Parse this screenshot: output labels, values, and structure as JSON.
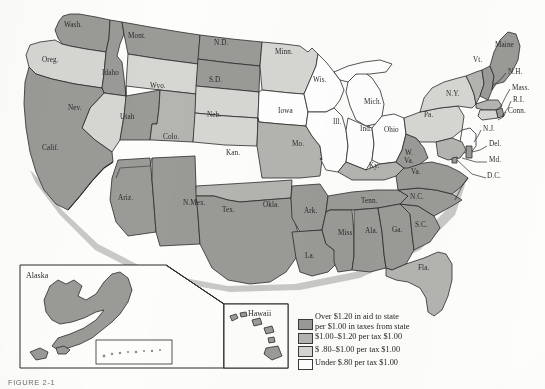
{
  "figure": {
    "caption": "FIGURE 2-1",
    "background_color": "#fdfdfc"
  },
  "palette": {
    "tier1_dark": "#9a9a97",
    "tier2_medium": "#b4b4b1",
    "tier3_light": "#d6d6d3",
    "tier4_white": "#ffffff",
    "outline": "#2a2a28",
    "label_color": "#2a2a28"
  },
  "legend": {
    "title": "",
    "items": [
      {
        "swatch_tier": "tier1_dark",
        "color": "#9a9a97",
        "line1": "Over $1.20 in aid to state",
        "line2": "per $1.00 in taxes from state"
      },
      {
        "swatch_tier": "tier2_medium",
        "color": "#b4b4b1",
        "line1": "$1.00–$1.20 per tax $1.00",
        "line2": ""
      },
      {
        "swatch_tier": "tier3_light",
        "color": "#d6d6d3",
        "line1": "$ .80–$1.00 per tax $1.00",
        "line2": ""
      },
      {
        "swatch_tier": "tier4_white",
        "color": "#ffffff",
        "line1": "Under $.80 per tax $1.00",
        "line2": ""
      }
    ]
  },
  "insets": [
    {
      "name": "alaska",
      "label": "Alaska"
    },
    {
      "name": "hawaii",
      "label": "Hawaii"
    }
  ],
  "map": {
    "title": "",
    "states": [
      {
        "abbr": "Wash.",
        "label": "Wash.",
        "tier": "tier1_dark",
        "lx": 64,
        "ly": 27
      },
      {
        "abbr": "Oreg.",
        "label": "Oreg.",
        "tier": "tier3_light",
        "lx": 42,
        "ly": 62
      },
      {
        "abbr": "Idaho",
        "label": "Idaho",
        "tier": "tier1_dark",
        "lx": 102,
        "ly": 75
      },
      {
        "abbr": "Mont.",
        "label": "Mont.",
        "tier": "tier1_dark",
        "lx": 128,
        "ly": 38
      },
      {
        "abbr": "Wyo.",
        "label": "Wyo.",
        "tier": "tier3_light",
        "lx": 150,
        "ly": 88
      },
      {
        "abbr": "Nev.",
        "label": "Nev.",
        "tier": "tier3_light",
        "lx": 68,
        "ly": 110
      },
      {
        "abbr": "Utah",
        "label": "Utah",
        "tier": "tier1_dark",
        "lx": 120,
        "ly": 119
      },
      {
        "abbr": "Calif.",
        "label": "Calif.",
        "tier": "tier1_dark",
        "lx": 42,
        "ly": 150
      },
      {
        "abbr": "Ariz.",
        "label": "Ariz.",
        "tier": "tier1_dark",
        "lx": 118,
        "ly": 200
      },
      {
        "abbr": "Colo.",
        "label": "Colo.",
        "tier": "tier2_medium",
        "lx": 163,
        "ly": 139
      },
      {
        "abbr": "N.Mex.",
        "label": "N.Mex.",
        "tier": "tier1_dark",
        "lx": 183,
        "ly": 205
      },
      {
        "abbr": "N.D.",
        "label": "N.D.",
        "tier": "tier1_dark",
        "lx": 214,
        "ly": 45
      },
      {
        "abbr": "S.D.",
        "label": "S.D.",
        "tier": "tier1_dark",
        "lx": 209,
        "ly": 82
      },
      {
        "abbr": "Neb.",
        "label": "Neb.",
        "tier": "tier3_light",
        "lx": 207,
        "ly": 117
      },
      {
        "abbr": "Kan.",
        "label": "Kan.",
        "tier": "tier3_light",
        "lx": 226,
        "ly": 155
      },
      {
        "abbr": "Okla.",
        "label": "Okla.",
        "tier": "tier2_medium",
        "lx": 263,
        "ly": 207
      },
      {
        "abbr": "Tex.",
        "label": "Tex.",
        "tier": "tier1_dark",
        "lx": 222,
        "ly": 212
      },
      {
        "abbr": "Minn.",
        "label": "Minn.",
        "tier": "tier3_light",
        "lx": 275,
        "ly": 54
      },
      {
        "abbr": "Iowa",
        "label": "Iowa",
        "tier": "tier4_white",
        "lx": 278,
        "ly": 113
      },
      {
        "abbr": "Mo.",
        "label": "Mo.",
        "tier": "tier2_medium",
        "lx": 292,
        "ly": 146
      },
      {
        "abbr": "Ark.",
        "label": "Ark.",
        "tier": "tier1_dark",
        "lx": 304,
        "ly": 213
      },
      {
        "abbr": "La.",
        "label": "La.",
        "tier": "tier1_dark",
        "lx": 305,
        "ly": 258
      },
      {
        "abbr": "Wis.",
        "label": "Wis.",
        "tier": "tier4_white",
        "lx": 313,
        "ly": 82
      },
      {
        "abbr": "Ill.",
        "label": "Ill.",
        "tier": "tier4_white",
        "lx": 333,
        "ly": 124
      },
      {
        "abbr": "Mich.",
        "label": "Mich.",
        "tier": "tier4_white",
        "lx": 364,
        "ly": 104
      },
      {
        "abbr": "Ind.",
        "label": "Ind.",
        "tier": "tier4_white",
        "lx": 360,
        "ly": 131
      },
      {
        "abbr": "Ohio",
        "label": "Ohio",
        "tier": "tier4_white",
        "lx": 384,
        "ly": 132
      },
      {
        "abbr": "Ky.",
        "label": "Ky.",
        "tier": "tier2_medium",
        "lx": 369,
        "ly": 168
      },
      {
        "abbr": "Tenn.",
        "label": "Tenn.",
        "tier": "tier1_dark",
        "lx": 361,
        "ly": 203
      },
      {
        "abbr": "Miss.",
        "label": "Miss.",
        "tier": "tier1_dark",
        "lx": 338,
        "ly": 235
      },
      {
        "abbr": "Ala.",
        "label": "Ala.",
        "tier": "tier1_dark",
        "lx": 365,
        "ly": 233
      },
      {
        "abbr": "Ga.",
        "label": "Ga.",
        "tier": "tier1_dark",
        "lx": 392,
        "ly": 232
      },
      {
        "abbr": "Fla.",
        "label": "Fla.",
        "tier": "tier2_medium",
        "lx": 418,
        "ly": 270
      },
      {
        "abbr": "S.C.",
        "label": "S.C.",
        "tier": "tier1_dark",
        "lx": 415,
        "ly": 227
      },
      {
        "abbr": "N.C.",
        "label": "N.C.",
        "tier": "tier1_dark",
        "lx": 410,
        "ly": 199
      },
      {
        "abbr": "Va.",
        "label": "Va.",
        "tier": "tier1_dark",
        "lx": 411,
        "ly": 174
      },
      {
        "abbr": "W. Va.",
        "label": "W.",
        "tier": "tier1_dark",
        "lx": 405,
        "ly": 155
      },
      {
        "abbr": "W.Va.2",
        "label": "Va.",
        "tier": "tier1_dark",
        "lx": 404,
        "ly": 163
      },
      {
        "abbr": "Pa.",
        "label": "Pa.",
        "tier": "tier3_light",
        "lx": 424,
        "ly": 117
      },
      {
        "abbr": "N.Y.",
        "label": "N.Y.",
        "tier": "tier3_light",
        "lx": 446,
        "ly": 96
      },
      {
        "abbr": "Vt.",
        "label": "Vt.",
        "tier": "tier2_medium",
        "lx": 473,
        "ly": 62
      },
      {
        "abbr": "Maine",
        "label": "Maine",
        "tier": "tier1_dark",
        "lx": 495,
        "ly": 47
      }
    ],
    "callouts": [
      {
        "name": "nh",
        "label": "N.H.",
        "lx": 508,
        "ly": 74
      },
      {
        "name": "mass",
        "label": "Mass.",
        "lx": 512,
        "ly": 90
      },
      {
        "name": "ri",
        "label": "R.I.",
        "lx": 513,
        "ly": 102
      },
      {
        "name": "conn",
        "label": "Conn.",
        "lx": 508,
        "ly": 113
      },
      {
        "name": "nj",
        "label": "N.J.",
        "lx": 483,
        "ly": 131
      },
      {
        "name": "del",
        "label": "Del.",
        "lx": 489,
        "ly": 146
      },
      {
        "name": "md",
        "label": "Md.",
        "lx": 489,
        "ly": 162
      },
      {
        "name": "dc",
        "label": "D.C.",
        "lx": 487,
        "ly": 178
      }
    ]
  }
}
